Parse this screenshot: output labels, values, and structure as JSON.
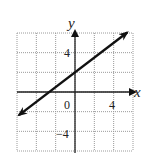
{
  "chart_data": {
    "type": "line",
    "title": "",
    "xlabel": "x",
    "ylabel": "y",
    "xlim": [
      -6,
      6
    ],
    "ylim": [
      -6,
      6
    ],
    "grid": true,
    "grid_step": 2,
    "x_tick_labels": [
      {
        "value": 0,
        "label": "0"
      },
      {
        "value": 4,
        "label": "4"
      }
    ],
    "y_tick_labels": [
      {
        "value": 4,
        "label": "4"
      },
      {
        "value": -4,
        "label": "-4"
      }
    ],
    "series": [
      {
        "name": "line",
        "equation": "y = 0.75x + 2",
        "slope": 0.75,
        "intercept": 2,
        "x": [
          -5.8,
          5.4
        ],
        "y": [
          -2.35,
          6.05
        ],
        "arrows": "both"
      }
    ]
  },
  "labels": {
    "x_axis": "x",
    "y_axis": "y",
    "origin": "0",
    "x4": "4",
    "y4": "4",
    "yneg4": "−4"
  }
}
